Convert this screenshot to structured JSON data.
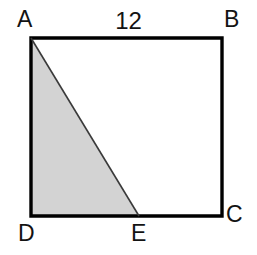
{
  "figure": {
    "kind": "geometry-diagram",
    "background_color": "#ffffff",
    "stroke_color": "#000000",
    "shaded_fill_color": "#d3d3d3",
    "shaded_stroke_color": "#3a3a3a",
    "outline_width": 3,
    "diagonal_width": 1.6,
    "vertex_labels": {
      "a": "A",
      "b": "B",
      "c": "C",
      "d": "D",
      "e": "E"
    },
    "measurements": {
      "top_side_length": "12"
    },
    "geometry": {
      "square": {
        "x_left": 31,
        "x_right": 222,
        "y_top": 38,
        "y_bottom": 216,
        "points": "31,38 222,38 222,216 31,216"
      },
      "shaded_triangle": {
        "vertices": [
          "A",
          "D",
          "E"
        ],
        "points": "31,38 31,216 139,216"
      },
      "point_e": {
        "x": 139,
        "y": 216
      },
      "diagonal_AE": {
        "x1": 31,
        "y1": 38,
        "x2": 139,
        "y2": 216
      }
    }
  }
}
